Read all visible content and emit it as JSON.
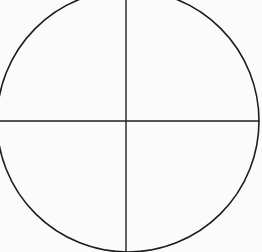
{
  "diagram": {
    "type": "circle-divided-into-quadrants",
    "background": "#fbfbfb",
    "stroke_color": "#1e1e1e",
    "circle": {
      "cx": 128,
      "cy": 121,
      "r": 131
    },
    "vertical_line": {
      "x": 126,
      "y1": 0,
      "y2": 252
    },
    "horizontal_line": {
      "y": 121,
      "x1": 0,
      "x2": 259
    }
  }
}
